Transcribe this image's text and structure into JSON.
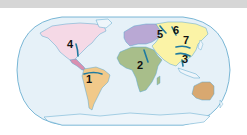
{
  "map": {
    "projection": "robinson-style oval world map",
    "colors": {
      "ocean": "#e6f1f8",
      "border": "#5aa6cc",
      "river": "#1f7aa0",
      "north_america": "#f5d9e6",
      "central_america": "#d98fb0",
      "south_america": "#f1c98a",
      "europe": "#b9a8d4",
      "africa": "#a8be8a",
      "asia": "#fbf3a6",
      "australia": "#d8a870",
      "antarctica": "#eef5fa",
      "topbar": "#d6d6d6"
    },
    "river_labels": [
      {
        "id": "1",
        "text": "1",
        "region": "South America"
      },
      {
        "id": "2",
        "text": "2",
        "region": "Africa"
      },
      {
        "id": "3",
        "text": "3",
        "region": "Asia (China)"
      },
      {
        "id": "4",
        "text": "4",
        "region": "North America"
      },
      {
        "id": "5",
        "text": "5",
        "region": "Asia (Siberia west)"
      },
      {
        "id": "6",
        "text": "6",
        "region": "Asia (Siberia central)"
      },
      {
        "id": "7",
        "text": "7",
        "region": "Asia (China north)"
      }
    ]
  }
}
